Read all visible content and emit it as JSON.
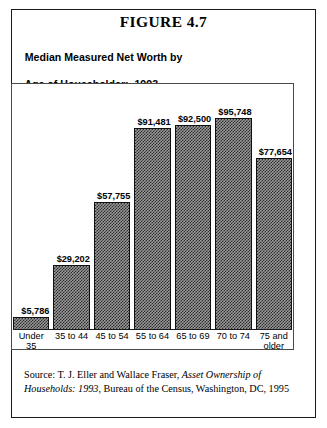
{
  "figure": {
    "caption": "FIGURE 4.7",
    "title_line1": "Median Measured Net Worth by",
    "title_line2": "Age of Householder:  1993"
  },
  "source": {
    "prefix": "Source: T. J. Eller and Wallace Fraser, ",
    "italic_title": "Asset Ownership of Households: 1993",
    "suffix": ", Bureau of the Census, Washington, DC, 1995"
  },
  "colors": {
    "bar_fill": "#9a9a9a",
    "bar_pattern": "#2b2b2b",
    "bar_border": "#111111",
    "frame": "#4a4a4a",
    "outer_border": "#1a1a1a",
    "text": "#000000",
    "background": "#ffffff"
  },
  "chart_data": {
    "type": "bar",
    "title": "Median Measured Net Worth by Age of Householder:  1993",
    "xlabel": "",
    "ylabel": "",
    "categories": [
      "Under 35",
      "35 to 44",
      "45 to 54",
      "55 to 64",
      "65 to 69",
      "70 to 74",
      "75 and\nolder"
    ],
    "values": [
      5786,
      29202,
      57755,
      91481,
      92500,
      95748,
      77654
    ],
    "data_labels": [
      "$5,786",
      "$29,202",
      "$57,755",
      "$91,481",
      "$92,500",
      "$95,748",
      "$77,654"
    ],
    "ylim": [
      0,
      103000
    ],
    "grid": false,
    "legend": null,
    "axis_ticks_visible": false,
    "value_labels_visible": true
  }
}
